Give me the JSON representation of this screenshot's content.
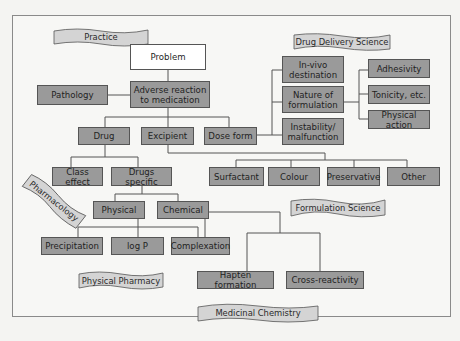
{
  "diagram": {
    "banners": {
      "practice": "Practice",
      "drug_delivery_science": "Drug Delivery Science",
      "pharmacology": "Pharmacology",
      "formulation_science": "Formulation Science",
      "physical_pharmacy": "Physical Pharmacy",
      "medicinal_chemistry": "Medicinal Chemistry"
    },
    "nodes": {
      "problem": "Problem",
      "adverse_reaction": "Adverse reaction\nto medication",
      "pathology": "Pathology",
      "drug": "Drug",
      "excipient": "Excipient",
      "dose_form": "Dose form",
      "in_vivo_destination": "In-vivo\ndestination",
      "nature_of_formulation": "Nature of\nformulation",
      "instability": "Instability/\nmalfunction",
      "adhesivity": "Adhesivity",
      "tonicity": "Tonicity, etc.",
      "physical_action": "Physical action",
      "class_effect": "Class effect",
      "drugs_specific": "Drugs specific",
      "surfactant": "Surfactant",
      "colour": "Colour",
      "preservative": "Preservative",
      "other": "Other",
      "physical": "Physical",
      "chemical": "Chemical",
      "precipitation": "Precipitation",
      "log_p": "log P",
      "complexation": "Complexation",
      "hapten_formation": "Hapten formation",
      "cross_reactivity": "Cross-reactivity"
    },
    "colors": {
      "node_fill": "#9a9a9a",
      "root_fill": "#ffffff",
      "banner_fill": "#d4d4d4",
      "line": "#555555"
    }
  }
}
